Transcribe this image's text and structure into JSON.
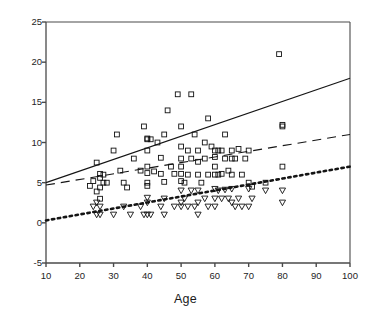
{
  "chart_data": {
    "type": "scatter",
    "title": "",
    "xlabel": "Age",
    "ylabel": "Number of wild plants known per person",
    "xlim": [
      10,
      100
    ],
    "ylim": [
      -5,
      25
    ],
    "xticks": [
      10,
      20,
      30,
      40,
      50,
      60,
      70,
      80,
      90,
      100
    ],
    "yticks": [
      -5,
      0,
      5,
      10,
      15,
      20,
      25
    ],
    "grid": false,
    "legend": "none",
    "series": [
      {
        "name": "wild plants known (squares)",
        "marker": "open-square",
        "points": [
          [
            23,
            4.6
          ],
          [
            24,
            5.2
          ],
          [
            25,
            7.5
          ],
          [
            25,
            3.9
          ],
          [
            26,
            6.1
          ],
          [
            26,
            5.6
          ],
          [
            26,
            4.4
          ],
          [
            26,
            3.0
          ],
          [
            27,
            6.0
          ],
          [
            27,
            5.0
          ],
          [
            28,
            5.0
          ],
          [
            30,
            9.0
          ],
          [
            31,
            11.0
          ],
          [
            32,
            6.5
          ],
          [
            33,
            5.0
          ],
          [
            34,
            4.4
          ],
          [
            36,
            8.0
          ],
          [
            38,
            6.5
          ],
          [
            39,
            12.0
          ],
          [
            40,
            10.5
          ],
          [
            40,
            10.4
          ],
          [
            40,
            9.0
          ],
          [
            40,
            7.0
          ],
          [
            40,
            6.2
          ],
          [
            40,
            5.0
          ],
          [
            40,
            4.6
          ],
          [
            41,
            10.4
          ],
          [
            42,
            6.4
          ],
          [
            43,
            10.0
          ],
          [
            44,
            8.1
          ],
          [
            44,
            6.1
          ],
          [
            45,
            11.0
          ],
          [
            45,
            5.1
          ],
          [
            46,
            14.0
          ],
          [
            47,
            7.0
          ],
          [
            48,
            6.1
          ],
          [
            49,
            16.0
          ],
          [
            50,
            12.0
          ],
          [
            50,
            9.5
          ],
          [
            50,
            8.0
          ],
          [
            50,
            7.0
          ],
          [
            50,
            6.1
          ],
          [
            50,
            5.2
          ],
          [
            51,
            5.0
          ],
          [
            52,
            9.0
          ],
          [
            52,
            6.0
          ],
          [
            53,
            16.0
          ],
          [
            53,
            8.0
          ],
          [
            54,
            11.0
          ],
          [
            55,
            9.0
          ],
          [
            55,
            7.6
          ],
          [
            55,
            6.0
          ],
          [
            56,
            5.0
          ],
          [
            57,
            10.0
          ],
          [
            57,
            8.0
          ],
          [
            58,
            13.0
          ],
          [
            58,
            6.0
          ],
          [
            59,
            9.5
          ],
          [
            60,
            9.0
          ],
          [
            60,
            8.2
          ],
          [
            60,
            7.0
          ],
          [
            60,
            6.0
          ],
          [
            61,
            9.0
          ],
          [
            61,
            6.0
          ],
          [
            62,
            9.0
          ],
          [
            62,
            6.1
          ],
          [
            63,
            11.0
          ],
          [
            63,
            8.0
          ],
          [
            64,
            6.5
          ],
          [
            65,
            9.0
          ],
          [
            65,
            8.0
          ],
          [
            65,
            6.0
          ],
          [
            66,
            8.0
          ],
          [
            67,
            9.2
          ],
          [
            68,
            6.0
          ],
          [
            69,
            8.0
          ],
          [
            70,
            9.0
          ],
          [
            70,
            5.0
          ],
          [
            71,
            4.5
          ],
          [
            75,
            5.0
          ],
          [
            79,
            21.0
          ],
          [
            80,
            12.2
          ],
          [
            80,
            12.0
          ],
          [
            80,
            7.0
          ]
        ]
      },
      {
        "name": "wild plants used (inverted triangles)",
        "marker": "open-triangle-down",
        "points": [
          [
            24,
            2.0
          ],
          [
            25,
            2.5
          ],
          [
            25,
            1.0
          ],
          [
            26,
            2.0
          ],
          [
            26,
            1.0
          ],
          [
            30,
            1.0
          ],
          [
            33,
            2.0
          ],
          [
            35,
            1.0
          ],
          [
            38,
            2.0
          ],
          [
            39,
            1.0
          ],
          [
            40,
            3.1
          ],
          [
            40,
            2.5
          ],
          [
            40,
            1.0
          ],
          [
            41,
            1.0
          ],
          [
            44,
            2.0
          ],
          [
            45,
            3.0
          ],
          [
            45,
            1.0
          ],
          [
            48,
            2.0
          ],
          [
            50,
            4.0
          ],
          [
            50,
            2.5
          ],
          [
            50,
            2.0
          ],
          [
            51,
            3.0
          ],
          [
            52,
            2.0
          ],
          [
            53,
            4.0
          ],
          [
            54,
            2.0
          ],
          [
            55,
            4.0
          ],
          [
            55,
            2.5
          ],
          [
            55,
            1.0
          ],
          [
            57,
            3.0
          ],
          [
            58,
            2.0
          ],
          [
            60,
            4.2
          ],
          [
            60,
            3.0
          ],
          [
            60,
            2.0
          ],
          [
            61,
            4.0
          ],
          [
            62,
            3.0
          ],
          [
            63,
            4.1
          ],
          [
            64,
            3.0
          ],
          [
            65,
            4.2
          ],
          [
            65,
            2.5
          ],
          [
            66,
            2.0
          ],
          [
            67,
            3.0
          ],
          [
            68,
            2.0
          ],
          [
            70,
            4.2
          ],
          [
            70,
            2.0
          ],
          [
            71,
            3.0
          ],
          [
            75,
            4.0
          ],
          [
            80,
            4.0
          ],
          [
            80,
            2.5
          ]
        ]
      }
    ],
    "trendlines": [
      {
        "name": "solid-regression",
        "style": "solid",
        "x0": 10,
        "y0": 5.0,
        "x1": 100,
        "y1": 18.0
      },
      {
        "name": "dashed-regression",
        "style": "dashed",
        "x0": 10,
        "y0": 4.7,
        "x1": 100,
        "y1": 11.0
      },
      {
        "name": "dotted-regression",
        "style": "dotted",
        "x0": 10,
        "y0": 0.3,
        "x1": 100,
        "y1": 7.0
      }
    ]
  },
  "axis": {
    "xlabel": "Age",
    "ylabel": "Number of wild plants known per person",
    "xticklabels": [
      "10",
      "20",
      "30",
      "40",
      "50",
      "60",
      "70",
      "80",
      "90",
      "100"
    ],
    "yticklabels": [
      "-5",
      "0",
      "5",
      "10",
      "15",
      "20",
      "25"
    ]
  },
  "colors": {
    "ink": "#1a1a1a",
    "axis": "#4a4a4a",
    "marker": "#111111",
    "background": "#ffffff"
  }
}
